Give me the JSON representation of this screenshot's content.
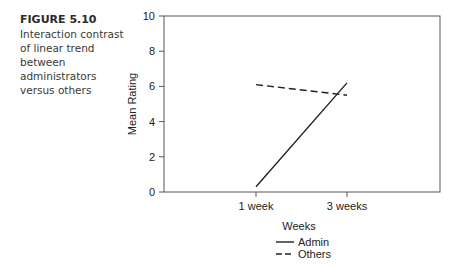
{
  "caption": {
    "figure_label": "FIGURE 5.10",
    "text": "Interaction contrast of linear trend between administrators versus others"
  },
  "chart_data": {
    "type": "line",
    "title": "",
    "xlabel": "Weeks",
    "ylabel": "Mean Rating",
    "categories": [
      "1 week",
      "3 weeks"
    ],
    "ylim": [
      0,
      10
    ],
    "yticks": [
      0,
      2,
      4,
      6,
      8,
      10
    ],
    "grid": false,
    "legend_position": "bottom",
    "series": [
      {
        "name": "Admin",
        "style": "solid",
        "values": [
          0.3,
          6.2
        ]
      },
      {
        "name": "Others",
        "style": "dashed",
        "values": [
          6.1,
          5.5
        ]
      }
    ]
  },
  "colors": {
    "line": "#222222",
    "axis": "#555555"
  }
}
